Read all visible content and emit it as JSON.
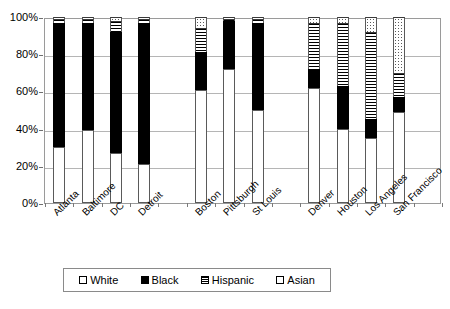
{
  "chart_data": {
    "type": "bar",
    "subtype": "stacked-bar-100-percent",
    "title": "",
    "xlabel": "",
    "ylabel": "",
    "ylim": [
      0,
      100
    ],
    "ytick_labels": [
      "0%",
      "20%",
      "40%",
      "60%",
      "80%",
      "100%"
    ],
    "ytick_values": [
      0,
      20,
      40,
      60,
      80,
      100
    ],
    "grid": true,
    "legend_position": "bottom",
    "categories": [
      "Atlanta",
      "Baltimore",
      "DC",
      "Detroit",
      "Boston",
      "Pittsburgh",
      "St Louis",
      "Denver",
      "Houston",
      "Los Angeles",
      "San Francisco"
    ],
    "series": [
      {
        "name": "White",
        "pattern": "empty",
        "color": "#ffffff",
        "values": [
          30,
          39,
          27,
          21,
          61,
          72,
          50,
          62,
          40,
          35,
          49
        ]
      },
      {
        "name": "Black",
        "pattern": "solid",
        "color": "#000000",
        "values": [
          67,
          58,
          65,
          76,
          20,
          26,
          47,
          10,
          23,
          10,
          8
        ]
      },
      {
        "name": "Hispanic",
        "pattern": "horizontal-stripes",
        "color": "#000000",
        "values": [
          2,
          2,
          6,
          2,
          13,
          1,
          2,
          25,
          34,
          47,
          13
        ]
      },
      {
        "name": "Asian",
        "pattern": "dotted",
        "color": "#5a5a5a",
        "values": [
          1,
          1,
          2,
          1,
          6,
          1,
          1,
          3,
          3,
          8,
          30
        ]
      }
    ]
  },
  "legend": {
    "items": [
      {
        "label": "White",
        "swatch": "white-swatch-icon"
      },
      {
        "label": "Black",
        "swatch": "black-swatch-icon"
      },
      {
        "label": "Hispanic",
        "swatch": "hispanic-swatch-icon"
      },
      {
        "label": "Asian",
        "swatch": "asian-swatch-icon"
      }
    ]
  },
  "axis": {
    "y_ticks": [
      "100%",
      "80%",
      "60%",
      "40%",
      "20%",
      "0%"
    ]
  }
}
